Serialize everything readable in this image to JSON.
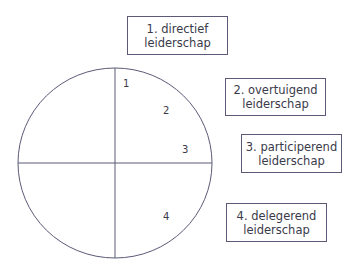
{
  "diagram": {
    "quadrant_labels": [
      "1",
      "2",
      "3",
      "4"
    ],
    "boxes": [
      {
        "line1": "1. directief",
        "line2": "leiderschap"
      },
      {
        "line1": "2. overtuigend",
        "line2": "leiderschap"
      },
      {
        "line1": "3. participerend",
        "line2": "leiderschap"
      },
      {
        "line1": "4. delegerend",
        "line2": "leiderschap"
      }
    ],
    "colors": {
      "stroke": "#5a5a78",
      "text": "#3a3a4a"
    }
  }
}
